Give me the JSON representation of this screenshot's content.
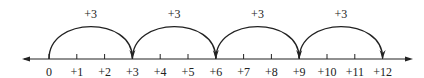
{
  "number_line": {
    "min": 0,
    "max": 12,
    "axis_arrows": [
      "left",
      "right"
    ],
    "tick_labels": [
      "0",
      "+1",
      "+2",
      "+3",
      "+4",
      "+5",
      "+6",
      "+7",
      "+8",
      "+9",
      "+10",
      "+11",
      "+12"
    ],
    "tick_values": [
      0,
      1,
      2,
      3,
      4,
      5,
      6,
      7,
      8,
      9,
      10,
      11,
      12
    ]
  },
  "jumps": [
    {
      "from": 0,
      "to": 3,
      "label": "+3"
    },
    {
      "from": 3,
      "to": 6,
      "label": "+3"
    },
    {
      "from": 6,
      "to": 9,
      "label": "+3"
    },
    {
      "from": 9,
      "to": 12,
      "label": "+3"
    }
  ],
  "colors": {
    "line": "#222222",
    "text": "#222222",
    "background": "#ffffff"
  }
}
